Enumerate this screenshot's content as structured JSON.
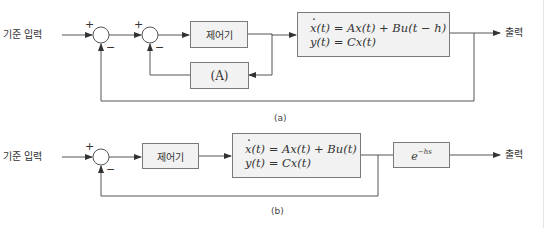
{
  "diagram_a": {
    "caption": "(a)",
    "input_label": "기준 입력",
    "output_label": "출력",
    "controller_label": "제어기",
    "block_A_label": "(A)",
    "plant": {
      "eq1_lhs": "x",
      "eq1_rest": "(t) = Ax(t) + Bu(t − h)",
      "eq2": "y(t) = Cx(t)"
    },
    "junction1": {
      "plus": "+",
      "minus": "−"
    },
    "junction2": {
      "plus": "+",
      "minus": "−"
    }
  },
  "diagram_b": {
    "caption": "(b)",
    "input_label": "기준 입력",
    "output_label": "출력",
    "controller_label": "제어기",
    "plant": {
      "eq1_lhs": "x",
      "eq1_rest": "(t) = Ax(t) + Bu(t)",
      "eq2": "y(t) = Cx(t)"
    },
    "delay_block": {
      "base": "e",
      "exponent": "−hs"
    },
    "junction1": {
      "plus": "+",
      "minus": "−"
    }
  },
  "colors": {
    "line": "#555555",
    "box_fill": "#f2f2f2",
    "box_border": "#7a7a7a",
    "text": "#333333"
  }
}
